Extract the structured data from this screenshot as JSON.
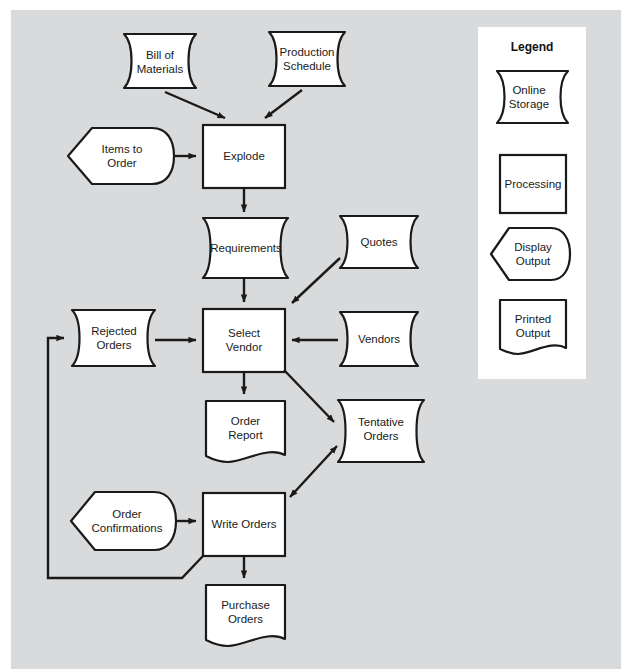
{
  "diagram": {
    "background_color": "#d9dadb",
    "shape_fill": "#ffffff",
    "stroke_color": "#1a1a1a",
    "nodes": [
      {
        "id": "bill_of_materials",
        "label": "Bill of\nMaterials",
        "shape": "online-storage"
      },
      {
        "id": "production_schedule",
        "label": "Production\nSchedule",
        "shape": "online-storage"
      },
      {
        "id": "items_to_order",
        "label": "Items to\nOrder",
        "shape": "display-output"
      },
      {
        "id": "explode",
        "label": "Explode",
        "shape": "processing"
      },
      {
        "id": "requirements",
        "label": "Requirements",
        "shape": "online-storage"
      },
      {
        "id": "quotes",
        "label": "Quotes",
        "shape": "online-storage"
      },
      {
        "id": "rejected_orders",
        "label": "Rejected\nOrders",
        "shape": "online-storage"
      },
      {
        "id": "select_vendor",
        "label": "Select\nVendor",
        "shape": "processing"
      },
      {
        "id": "vendors",
        "label": "Vendors",
        "shape": "online-storage"
      },
      {
        "id": "order_report",
        "label": "Order\nReport",
        "shape": "printed-output"
      },
      {
        "id": "tentative_orders",
        "label": "Tentative\nOrders",
        "shape": "online-storage"
      },
      {
        "id": "order_confirmations",
        "label": "Order\nConfirmations",
        "shape": "display-output"
      },
      {
        "id": "write_orders",
        "label": "Write Orders",
        "shape": "processing"
      },
      {
        "id": "purchase_orders",
        "label": "Purchase\nOrders",
        "shape": "printed-output"
      }
    ],
    "edges": [
      {
        "from": "bill_of_materials",
        "to": "explode",
        "arrow": "single"
      },
      {
        "from": "production_schedule",
        "to": "explode",
        "arrow": "single"
      },
      {
        "from": "items_to_order",
        "to": "explode",
        "arrow": "single"
      },
      {
        "from": "explode",
        "to": "requirements",
        "arrow": "single"
      },
      {
        "from": "requirements",
        "to": "select_vendor",
        "arrow": "single"
      },
      {
        "from": "quotes",
        "to": "select_vendor",
        "arrow": "single"
      },
      {
        "from": "vendors",
        "to": "select_vendor",
        "arrow": "single"
      },
      {
        "from": "rejected_orders",
        "to": "select_vendor",
        "arrow": "single"
      },
      {
        "from": "select_vendor",
        "to": "order_report",
        "arrow": "single"
      },
      {
        "from": "select_vendor",
        "to": "tentative_orders",
        "arrow": "single"
      },
      {
        "from": "write_orders",
        "to": "tentative_orders",
        "arrow": "double"
      },
      {
        "from": "order_confirmations",
        "to": "write_orders",
        "arrow": "single"
      },
      {
        "from": "write_orders",
        "to": "purchase_orders",
        "arrow": "single"
      },
      {
        "from": "write_orders",
        "to": "rejected_orders",
        "arrow": "single"
      }
    ]
  },
  "legend": {
    "title": "Legend",
    "panel_color": "#ffffff",
    "items": [
      {
        "id": "legend_online_storage",
        "label": "Online\nStorage",
        "shape": "online-storage"
      },
      {
        "id": "legend_processing",
        "label": "Processing",
        "shape": "processing"
      },
      {
        "id": "legend_display_output",
        "label": "Display\nOutput",
        "shape": "display-output"
      },
      {
        "id": "legend_printed_output",
        "label": "Printed\nOutput",
        "shape": "printed-output"
      }
    ]
  }
}
